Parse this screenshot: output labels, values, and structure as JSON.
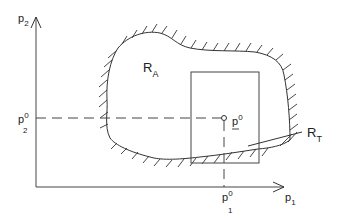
{
  "diagram": {
    "axes": {
      "x_label": "p",
      "x_sub": "1",
      "y_label": "p",
      "y_sub": "2"
    },
    "region_a": {
      "label": "R",
      "sub": "A"
    },
    "region_t": {
      "label": "R",
      "sub": "T"
    },
    "point": {
      "label": "p",
      "sup": "0"
    },
    "x_marker": {
      "label": "p",
      "sup": "0",
      "sub": "1"
    },
    "y_marker": {
      "label": "p",
      "sup": "0",
      "sub": "2"
    },
    "colors": {
      "stroke": "#333333",
      "background": "#ffffff"
    }
  }
}
